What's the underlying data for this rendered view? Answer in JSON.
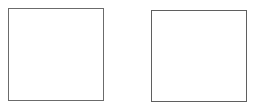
{
  "frames": [
    {
      "id": "left",
      "label": "",
      "border_color": "#6b6b6b"
    },
    {
      "id": "right",
      "label": "",
      "border_color": "#5f5f5f"
    }
  ]
}
